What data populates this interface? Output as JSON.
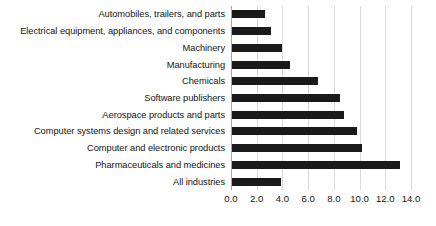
{
  "chart_data": {
    "type": "bar",
    "orientation": "horizontal",
    "title": "",
    "subtitle": "",
    "xlabel": "",
    "ylabel": "",
    "xlim": [
      0.0,
      14.0
    ],
    "xticks": [
      "0.0",
      "2.0",
      "4.0",
      "6.0",
      "8.0",
      "10.0",
      "12.0",
      "14.0"
    ],
    "xtick_values": [
      0.0,
      2.0,
      4.0,
      6.0,
      8.0,
      10.0,
      12.0,
      14.0
    ],
    "grid": "vertical",
    "legend": "none",
    "bar_color": "#1a1a1a",
    "gridline_color": "#d9d9d9",
    "axis_color": "#a6a6a6",
    "categories": [
      "Automobiles, trailers, and parts",
      "Electrical equipment, appliances, and components",
      "Machinery",
      "Manufacturing",
      "Chemicals",
      "Software publishers",
      "Aerospace products and parts",
      "Computer systems design and related services",
      "Computer and electronic products",
      "Pharmaceuticals and medicines",
      "All industries"
    ],
    "values": [
      2.6,
      3.0,
      3.9,
      4.5,
      6.7,
      8.4,
      8.7,
      9.7,
      10.1,
      13.1,
      3.8
    ]
  }
}
